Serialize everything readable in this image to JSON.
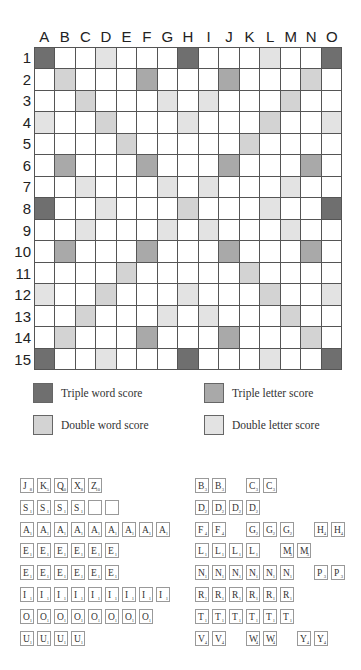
{
  "board": {
    "columns": [
      "A",
      "B",
      "C",
      "D",
      "E",
      "F",
      "G",
      "H",
      "I",
      "J",
      "K",
      "L",
      "M",
      "N",
      "O"
    ],
    "rows": [
      "1",
      "2",
      "3",
      "4",
      "5",
      "6",
      "7",
      "8",
      "9",
      "10",
      "11",
      "12",
      "13",
      "14",
      "15"
    ],
    "colors": {
      "tw": "#6f6f6f",
      "dw": "#d3d3d3",
      "tl": "#a9a9a9",
      "dl": "#e3e3e3",
      "plain": "#ffffff"
    },
    "layout": [
      "tw,,,dl,,,,tw,,,,dl,,,tw",
      ",dw,,,,tl,,,,tl,,,,dw,",
      ",,dw,,,,dl,,dl,,,,dw,,",
      "dl,,,dw,,,,dl,,,,dw,,,dl",
      ",,,,dw,,,,,,dw,,,,",
      ",tl,,,,tl,,,,tl,,,,tl,",
      ",,dl,,,,dl,,dl,,,,dl,,",
      "tw,,,dl,,,,dw,,,,dl,,,tw",
      ",,dl,,,,dl,,dl,,,,dl,,",
      ",tl,,,,tl,,,,tl,,,,tl,",
      ",,,,dw,,,,,,dw,,,,",
      "dl,,,dw,,,,dl,,,,dw,,,dl",
      ",,dw,,,,dl,,dl,,,,dw,,",
      ",dw,,,,tl,,,,tl,,,,dw,",
      "tw,,,dl,,,,tw,,,,dl,,,tw"
    ]
  },
  "legend": {
    "triple_word": "Triple word score",
    "triple_letter": "Triple letter score",
    "double_word": "Double word score",
    "double_letter": "Double letter score"
  },
  "tiles": {
    "left": [
      [
        [
          "J",
          "8"
        ],
        [
          "K",
          "5"
        ],
        [
          "Q",
          "10"
        ],
        [
          "X",
          "8"
        ],
        [
          "Z",
          "10"
        ]
      ],
      [
        [
          "S",
          "1"
        ],
        [
          "S",
          "1"
        ],
        [
          "S",
          "1"
        ],
        [
          "S",
          "1"
        ],
        [
          "",
          ""
        ],
        [
          "",
          ""
        ]
      ],
      [
        [
          "A",
          "1"
        ],
        [
          "A",
          "1"
        ],
        [
          "A",
          "1"
        ],
        [
          "A",
          "1"
        ],
        [
          "A",
          "1"
        ],
        [
          "A",
          "1"
        ],
        [
          "A",
          "1"
        ],
        [
          "A",
          "1"
        ],
        [
          "A",
          "1"
        ]
      ],
      [
        [
          "E",
          "1"
        ],
        [
          "E",
          "1"
        ],
        [
          "E",
          "1"
        ],
        [
          "E",
          "1"
        ],
        [
          "E",
          "1"
        ],
        [
          "E",
          "1"
        ]
      ],
      [
        [
          "E",
          "1"
        ],
        [
          "E",
          "1"
        ],
        [
          "E",
          "1"
        ],
        [
          "E",
          "1"
        ],
        [
          "E",
          "1"
        ],
        [
          "E",
          "1"
        ]
      ],
      [
        [
          "I",
          "1"
        ],
        [
          "I",
          "1"
        ],
        [
          "I",
          "1"
        ],
        [
          "I",
          "1"
        ],
        [
          "I",
          "1"
        ],
        [
          "I",
          "1"
        ],
        [
          "I",
          "1"
        ],
        [
          "I",
          "1"
        ],
        [
          "I",
          "1"
        ]
      ],
      [
        [
          "O",
          "1"
        ],
        [
          "O",
          "1"
        ],
        [
          "O",
          "1"
        ],
        [
          "O",
          "1"
        ],
        [
          "O",
          "1"
        ],
        [
          "O",
          "1"
        ],
        [
          "O",
          "1"
        ],
        [
          "O",
          "1"
        ]
      ],
      [
        [
          "U",
          "1"
        ],
        [
          "U",
          "1"
        ],
        [
          "U",
          "1"
        ],
        [
          "U",
          "1"
        ]
      ]
    ],
    "right": [
      [
        [
          "B",
          "3"
        ],
        [
          "B",
          "3"
        ],
        null,
        [
          "C",
          "3"
        ],
        [
          "C",
          "3"
        ]
      ],
      [
        [
          "D",
          "2"
        ],
        [
          "D",
          "2"
        ],
        [
          "D",
          "2"
        ],
        [
          "D",
          "2"
        ]
      ],
      [
        [
          "F",
          "4"
        ],
        [
          "F",
          "4"
        ],
        null,
        [
          "G",
          "2"
        ],
        [
          "G",
          "2"
        ],
        [
          "G",
          "2"
        ],
        null,
        [
          "H",
          "4"
        ],
        [
          "H",
          "4"
        ]
      ],
      [
        [
          "L",
          "1"
        ],
        [
          "L",
          "1"
        ],
        [
          "L",
          "1"
        ],
        [
          "L",
          "1"
        ],
        null,
        [
          "M",
          "3"
        ],
        [
          "M",
          "3"
        ]
      ],
      [
        [
          "N",
          "1"
        ],
        [
          "N",
          "1"
        ],
        [
          "N",
          "1"
        ],
        [
          "N",
          "1"
        ],
        [
          "N",
          "1"
        ],
        [
          "N",
          "1"
        ],
        null,
        [
          "P",
          "3"
        ],
        [
          "P",
          "3"
        ]
      ],
      [
        [
          "R",
          "1"
        ],
        [
          "R",
          "1"
        ],
        [
          "R",
          "1"
        ],
        [
          "R",
          "1"
        ],
        [
          "R",
          "1"
        ],
        [
          "R",
          "1"
        ]
      ],
      [
        [
          "T",
          "1"
        ],
        [
          "T",
          "1"
        ],
        [
          "T",
          "1"
        ],
        [
          "T",
          "1"
        ],
        [
          "T",
          "1"
        ],
        [
          "T",
          "1"
        ]
      ],
      [
        [
          "V",
          "4"
        ],
        [
          "V",
          "4"
        ],
        null,
        [
          "W",
          "4"
        ],
        [
          "W",
          "4"
        ],
        null,
        [
          "Y",
          "4"
        ],
        [
          "Y",
          "4"
        ]
      ]
    ]
  }
}
